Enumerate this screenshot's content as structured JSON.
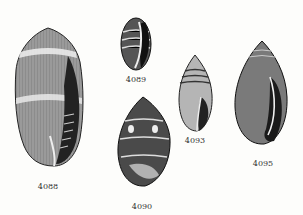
{
  "plate": {
    "figures": [
      {
        "id": "4088",
        "label": "4088"
      },
      {
        "id": "4089",
        "label": "4089"
      },
      {
        "id": "4090",
        "label": "4090"
      },
      {
        "id": "4093",
        "label": "4093"
      },
      {
        "id": "4095",
        "label": "4095"
      }
    ]
  }
}
